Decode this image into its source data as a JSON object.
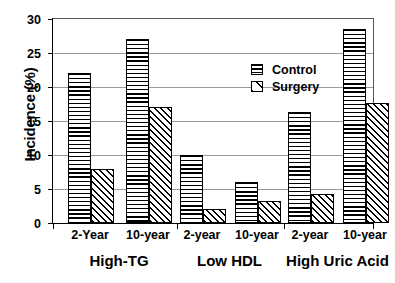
{
  "chart_data": {
    "type": "bar",
    "title": "",
    "xlabel": "",
    "ylabel": "Incidence (%)",
    "ylim": [
      0,
      30
    ],
    "yticks": [
      0,
      5,
      10,
      15,
      20,
      25,
      30
    ],
    "ytick_labels": [
      "0",
      "5",
      "10",
      "15",
      "20",
      "25",
      "30"
    ],
    "grid": true,
    "legend_position": "inside-upper-center",
    "categories": [
      "2-Year",
      "10-year",
      "2-year",
      "10-year",
      "2-year",
      "10-year"
    ],
    "groups": [
      {
        "label": "High-TG",
        "periods": [
          "2-Year",
          "10-year"
        ]
      },
      {
        "label": "Low HDL",
        "periods": [
          "2-year",
          "10-year"
        ]
      },
      {
        "label": "High Uric Acid",
        "periods": [
          "2-year",
          "10-year"
        ]
      }
    ],
    "series": [
      {
        "name": "Control",
        "pattern": "horizontal-stripes",
        "values": [
          22,
          27,
          10,
          6,
          16.3,
          28.5
        ]
      },
      {
        "name": "Surgery",
        "pattern": "diagonal-hatch",
        "values": [
          8,
          17,
          2,
          3.3,
          4.3,
          17.7
        ]
      }
    ],
    "legend": [
      "Control",
      "Surgery"
    ]
  }
}
